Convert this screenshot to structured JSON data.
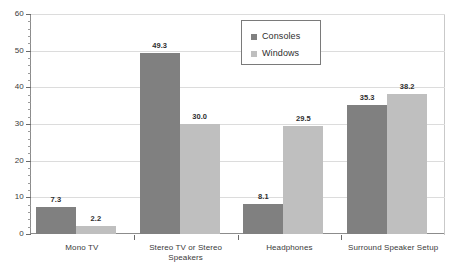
{
  "chart_data": {
    "type": "bar",
    "title": "",
    "subtitle": "",
    "xlabel": "",
    "ylabel": "",
    "ylim": [
      0,
      60
    ],
    "ytick_step": 10,
    "yminor_step": 2,
    "grid": true,
    "legend_position": "top-right-inside",
    "categories": [
      "Mono TV",
      "Stereo TV or Stereo Speakers",
      "Headphones",
      "Surround Speaker Setup"
    ],
    "series": [
      {
        "name": "Consoles",
        "color": "#808080",
        "values": [
          7.3,
          49.3,
          8.1,
          35.3
        ]
      },
      {
        "name": "Windows",
        "color": "#bfbfbf",
        "values": [
          2.2,
          30.0,
          29.5,
          38.2
        ]
      }
    ],
    "ytick_labels": [
      "60",
      "50",
      "40",
      "30",
      "20",
      "10",
      "0"
    ],
    "data_labels": [
      [
        "7.3",
        "2.2"
      ],
      [
        "49.3",
        "30.0"
      ],
      [
        "8.1",
        "29.5"
      ],
      [
        "35.3",
        "38.2"
      ]
    ],
    "category_lines": [
      [
        "Mono TV"
      ],
      [
        "Stereo TV or Stereo",
        "Speakers"
      ],
      [
        "Headphones"
      ],
      [
        "Surround Speaker Setup"
      ]
    ]
  },
  "legend": {
    "items": [
      {
        "label": "Consoles"
      },
      {
        "label": "Windows"
      }
    ]
  },
  "colors": {
    "consoles": "#808080",
    "windows": "#bfbfbf",
    "gridline": "#dcdcdc",
    "axis": "#8c8c8c",
    "text": "#3a3a3a",
    "background": "#ffffff"
  }
}
